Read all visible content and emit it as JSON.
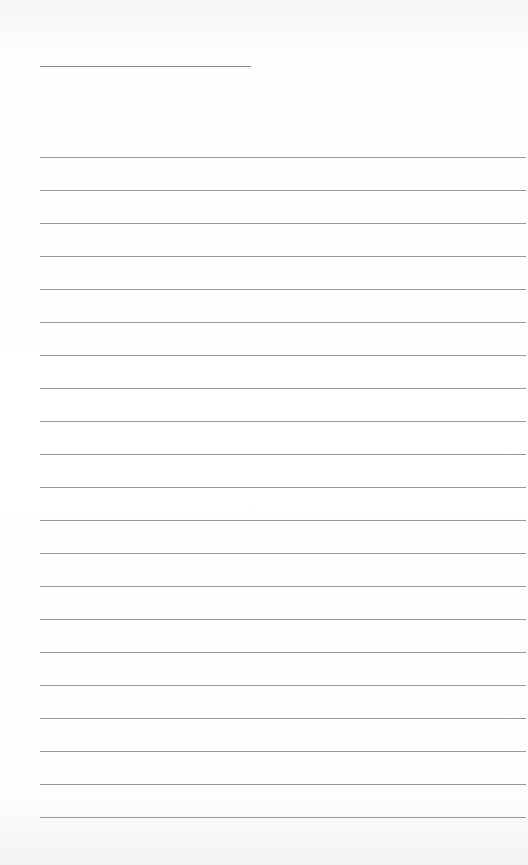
{
  "page": {
    "type": "blank ruled notebook page",
    "colors": {
      "paper": "#ffffff",
      "rule": "#9a9a9a",
      "title_rule": "#8a8a8a"
    },
    "title_line": {
      "x": 40,
      "y": 66,
      "width": 211
    },
    "ruled_lines": {
      "count": 21,
      "start_y": 157,
      "spacing": 33,
      "x_start": 40,
      "x_end": 526
    }
  }
}
